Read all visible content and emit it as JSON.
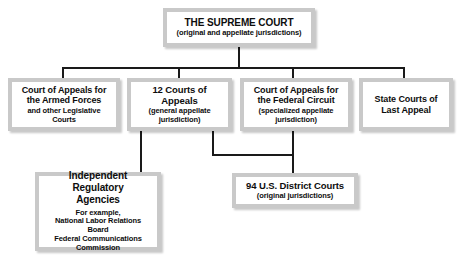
{
  "diagram": {
    "type": "organizational-hierarchy",
    "colors": {
      "box_border": "#c9c9c9",
      "box_fill": "#ffffff",
      "line": "#1a1a1a",
      "text": "#0d0d0d",
      "page_background": "#ffffff"
    },
    "nodes": {
      "supreme_court": {
        "title": "THE SUPREME COURT",
        "subtitle": "(original and appellate jurisdictions)"
      },
      "armed_forces": {
        "title": "Court of  Appeals for\nthe Armed Forces",
        "subtitle": "and other Legislative\nCourts"
      },
      "courts_appeals_12": {
        "title": "12 Courts of Appeals",
        "subtitle": "(general appellate\njurisdiction)"
      },
      "federal_circuit": {
        "title": "Court of Appeals for\nthe Federal Circuit",
        "subtitle": "(specialized appellate\njurisdiction)"
      },
      "state_courts": {
        "title": "State Courts of\nLast Appeal",
        "subtitle": ""
      },
      "independent_agencies": {
        "title": "Independent Regulatory\nAgencies",
        "subtitle": "For example,\nNational Labor Relations\nBoard\nFederal Communications\nCommission"
      },
      "district_courts": {
        "title": "94 U.S. District Courts",
        "subtitle": "(original jurisdictions)"
      }
    }
  }
}
